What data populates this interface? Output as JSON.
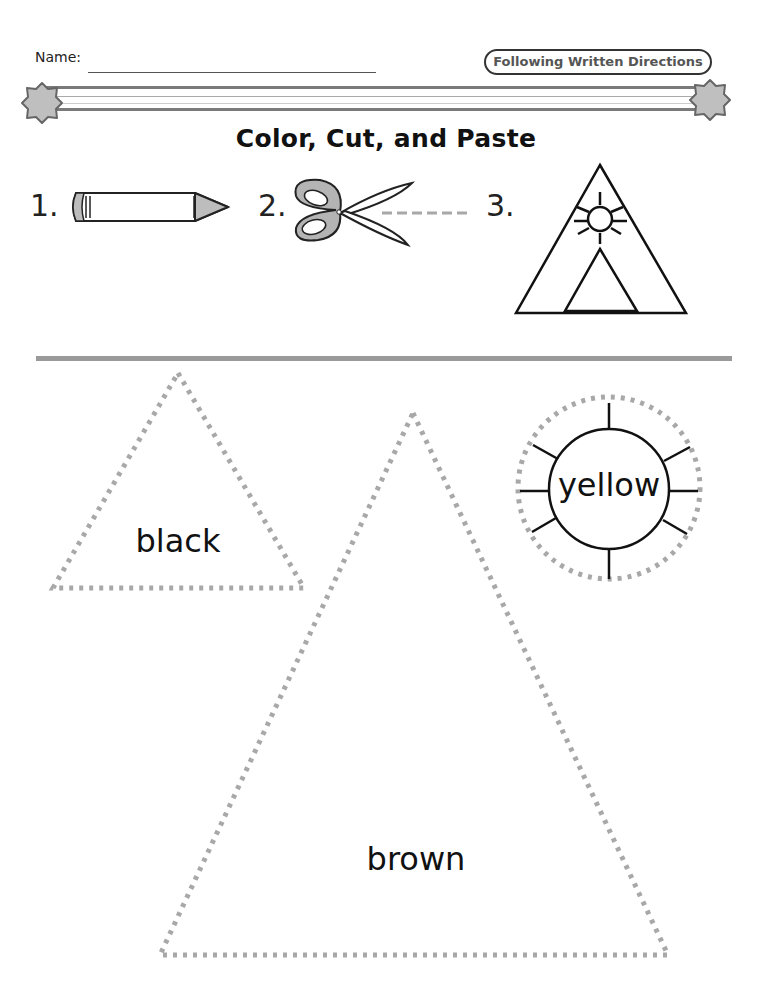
{
  "header": {
    "name_label": "Name:",
    "badge": "Following Written Directions"
  },
  "title": "Color, Cut, and Paste",
  "steps": [
    {
      "number": "1.",
      "icon": "crayon-icon"
    },
    {
      "number": "2.",
      "icon": "scissors-icon"
    },
    {
      "number": "3.",
      "icon": "teepee-with-sun-icon"
    }
  ],
  "cutouts": [
    {
      "shape": "small-triangle",
      "label": "black"
    },
    {
      "shape": "large-triangle",
      "label": "brown"
    },
    {
      "shape": "sun-circle",
      "label": "yellow"
    }
  ],
  "colors": {
    "ink": "#1a1a1a",
    "gray_fill": "#bdbdbd",
    "dotted": "#a8a8a8",
    "rule": "#9a9a9a"
  }
}
